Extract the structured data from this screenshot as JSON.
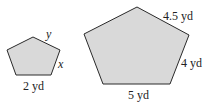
{
  "figures": [
    {
      "id": "small-pentagon",
      "fill": "#d9d9d9",
      "stroke": "#2a2a2a",
      "points": "33,37 60,50 51,75 16,75 7,50",
      "labels": {
        "top_right_side": "y",
        "right_side": "x",
        "bottom_side": "2 yd"
      }
    },
    {
      "id": "large-pentagon",
      "fill": "#d9d9d9",
      "stroke": "#2a2a2a",
      "points": "137,7 189,35 170,84 103,84 84,34",
      "labels": {
        "top_right_side": "4.5 yd",
        "right_side": "4 yd",
        "bottom_side": "5 yd"
      }
    }
  ]
}
